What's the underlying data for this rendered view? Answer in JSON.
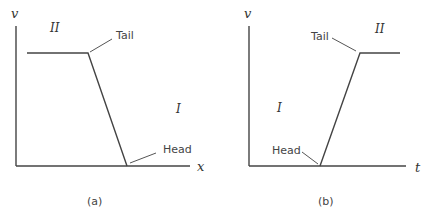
{
  "panels": [
    {
      "id": "a",
      "caption": "(a)",
      "y_axis_label": "v",
      "x_axis_label": "x",
      "region_upper": "II",
      "region_lower": "I",
      "tail_label": "Tail",
      "head_label": "Head"
    },
    {
      "id": "b",
      "caption": "(b)",
      "y_axis_label": "v",
      "x_axis_label": "t",
      "region_upper": "II",
      "region_lower": "I",
      "tail_label": "Tail",
      "head_label": "Head"
    }
  ]
}
